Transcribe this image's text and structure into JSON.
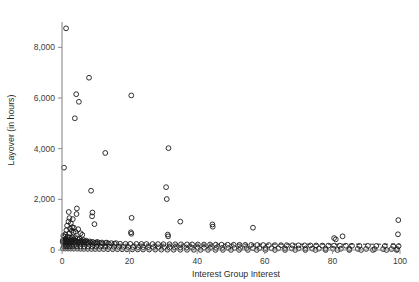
{
  "figure": {
    "background_color": "#ffffff",
    "marker_color": "#1a1a1a",
    "axis_color": "#8a8a8a",
    "text_color": "#2b2b2b"
  },
  "chart_data": {
    "type": "scatter",
    "title": "",
    "xlabel": "Interest Group Interest",
    "ylabel": "Layover (in hours)",
    "xlim": [
      0,
      100
    ],
    "ylim": [
      0,
      9000
    ],
    "xticks": [
      0,
      20,
      40,
      60,
      80,
      100
    ],
    "xtick_labels": [
      "0",
      "20",
      "40",
      "60",
      "80",
      "100"
    ],
    "yticks": [
      0,
      2000,
      4000,
      6000,
      8000
    ],
    "ytick_labels": [
      "0",
      "2,000",
      "4,000",
      "6,000",
      "8,000"
    ],
    "grid": false,
    "legend": null,
    "marker_style": "open-circle",
    "marker_radius": 2.4,
    "reference_line": {
      "style": "dashed",
      "orientation": "horizontal",
      "y": 230,
      "x_start": 0,
      "x_end": 100
    },
    "points": [
      [
        1.2,
        8750
      ],
      [
        8.0,
        6800
      ],
      [
        4.2,
        6150
      ],
      [
        20.5,
        6100
      ],
      [
        5.0,
        5850
      ],
      [
        3.8,
        5200
      ],
      [
        31.5,
        4020
      ],
      [
        12.8,
        3830
      ],
      [
        0.6,
        3250
      ],
      [
        30.8,
        2480
      ],
      [
        8.6,
        2340
      ],
      [
        31.0,
        2010
      ],
      [
        4.4,
        1640
      ],
      [
        2.0,
        1500
      ],
      [
        9.0,
        1480
      ],
      [
        4.3,
        1420
      ],
      [
        8.9,
        1330
      ],
      [
        20.6,
        1270
      ],
      [
        2.2,
        1260
      ],
      [
        3.2,
        1220
      ],
      [
        35.0,
        1120
      ],
      [
        1.9,
        1120
      ],
      [
        2.6,
        1050
      ],
      [
        9.6,
        1020
      ],
      [
        44.5,
        1010
      ],
      [
        44.6,
        920
      ],
      [
        1.5,
        960
      ],
      [
        3.0,
        900
      ],
      [
        3.5,
        880
      ],
      [
        56.5,
        880
      ],
      [
        2.4,
        840
      ],
      [
        4.8,
        820
      ],
      [
        20.4,
        700
      ],
      [
        20.5,
        640
      ],
      [
        1.3,
        780
      ],
      [
        2.9,
        760
      ],
      [
        4.0,
        720
      ],
      [
        3.4,
        690
      ],
      [
        5.5,
        660
      ],
      [
        2.1,
        650
      ],
      [
        1.0,
        620
      ],
      [
        6.0,
        600
      ],
      [
        31.3,
        610
      ],
      [
        31.4,
        540
      ],
      [
        99.5,
        1180
      ],
      [
        99.4,
        620
      ],
      [
        83.0,
        540
      ],
      [
        80.5,
        470
      ],
      [
        81.0,
        420
      ],
      [
        0.4,
        560
      ],
      [
        0.8,
        530
      ],
      [
        1.6,
        520
      ],
      [
        2.3,
        500
      ],
      [
        3.1,
        490
      ],
      [
        3.9,
        470
      ],
      [
        4.6,
        460
      ],
      [
        5.2,
        450
      ],
      [
        1.1,
        440
      ],
      [
        2.7,
        430
      ],
      [
        0.9,
        420
      ],
      [
        1.8,
        410
      ],
      [
        3.3,
        405
      ],
      [
        4.9,
        400
      ],
      [
        6.4,
        395
      ],
      [
        0.3,
        390
      ],
      [
        1.4,
        385
      ],
      [
        2.5,
        380
      ],
      [
        3.7,
        375
      ],
      [
        5.8,
        370
      ],
      [
        7.2,
        365
      ],
      [
        0.6,
        360
      ],
      [
        1.7,
        355
      ],
      [
        2.8,
        350
      ],
      [
        4.1,
        348
      ],
      [
        5.4,
        345
      ],
      [
        6.8,
        342
      ],
      [
        8.2,
        340
      ],
      [
        0.2,
        338
      ],
      [
        1.0,
        335
      ],
      [
        2.0,
        332
      ],
      [
        3.0,
        330
      ],
      [
        4.4,
        328
      ],
      [
        5.9,
        325
      ],
      [
        7.5,
        322
      ],
      [
        9.1,
        320
      ],
      [
        10.5,
        318
      ],
      [
        0.5,
        315
      ],
      [
        1.3,
        312
      ],
      [
        2.2,
        310
      ],
      [
        3.6,
        308
      ],
      [
        5.0,
        305
      ],
      [
        6.6,
        302
      ],
      [
        8.4,
        300
      ],
      [
        10.1,
        298
      ],
      [
        11.8,
        295
      ],
      [
        13.2,
        292
      ],
      [
        0.7,
        290
      ],
      [
        1.9,
        288
      ],
      [
        3.2,
        286
      ],
      [
        4.7,
        284
      ],
      [
        6.2,
        282
      ],
      [
        7.9,
        280
      ],
      [
        9.6,
        278
      ],
      [
        11.2,
        276
      ],
      [
        12.9,
        274
      ],
      [
        14.6,
        272
      ],
      [
        16.0,
        270
      ],
      [
        0.4,
        268
      ],
      [
        1.5,
        266
      ],
      [
        2.6,
        264
      ],
      [
        4.0,
        262
      ],
      [
        5.5,
        260
      ],
      [
        7.1,
        258
      ],
      [
        8.8,
        256
      ],
      [
        10.4,
        254
      ],
      [
        12.1,
        252
      ],
      [
        13.8,
        250
      ],
      [
        15.5,
        248
      ],
      [
        17.2,
        246
      ],
      [
        18.8,
        244
      ],
      [
        20.2,
        242
      ],
      [
        22.0,
        240
      ],
      [
        23.5,
        238
      ],
      [
        25.0,
        236
      ],
      [
        26.8,
        234
      ],
      [
        28.4,
        232
      ],
      [
        30.0,
        230
      ],
      [
        31.8,
        228
      ],
      [
        33.5,
        226
      ],
      [
        35.2,
        224
      ],
      [
        37.0,
        222
      ],
      [
        38.5,
        220
      ],
      [
        40.2,
        218
      ],
      [
        42.0,
        216
      ],
      [
        43.8,
        214
      ],
      [
        45.5,
        212
      ],
      [
        47.2,
        210
      ],
      [
        49.0,
        208
      ],
      [
        50.8,
        206
      ],
      [
        52.5,
        204
      ],
      [
        54.2,
        202
      ],
      [
        56.0,
        200
      ],
      [
        57.8,
        198
      ],
      [
        59.5,
        196
      ],
      [
        61.2,
        194
      ],
      [
        63.0,
        192
      ],
      [
        64.8,
        190
      ],
      [
        66.5,
        188
      ],
      [
        68.2,
        186
      ],
      [
        70.0,
        184
      ],
      [
        71.8,
        182
      ],
      [
        73.5,
        180
      ],
      [
        75.2,
        178
      ],
      [
        77.0,
        176
      ],
      [
        78.8,
        174
      ],
      [
        80.5,
        172
      ],
      [
        82.2,
        170
      ],
      [
        84.0,
        168
      ],
      [
        85.8,
        166
      ],
      [
        88.0,
        164
      ],
      [
        90.5,
        162
      ],
      [
        93.0,
        160
      ],
      [
        95.5,
        158
      ],
      [
        98.0,
        156
      ],
      [
        99.6,
        154
      ],
      [
        0.5,
        150
      ],
      [
        1.2,
        148
      ],
      [
        2.1,
        146
      ],
      [
        3.0,
        144
      ],
      [
        4.2,
        142
      ],
      [
        5.4,
        140
      ],
      [
        6.6,
        138
      ],
      [
        7.8,
        136
      ],
      [
        9.0,
        134
      ],
      [
        10.2,
        132
      ],
      [
        11.5,
        130
      ],
      [
        12.8,
        128
      ],
      [
        14.0,
        126
      ],
      [
        15.4,
        124
      ],
      [
        16.8,
        122
      ],
      [
        18.2,
        120
      ],
      [
        19.6,
        118
      ],
      [
        21.0,
        116
      ],
      [
        22.5,
        114
      ],
      [
        24.0,
        112
      ],
      [
        25.5,
        110
      ],
      [
        27.0,
        108
      ],
      [
        28.5,
        106
      ],
      [
        30.2,
        104
      ],
      [
        31.8,
        102
      ],
      [
        33.4,
        100
      ],
      [
        35.0,
        98
      ],
      [
        36.8,
        96
      ],
      [
        38.5,
        94
      ],
      [
        40.2,
        92
      ],
      [
        42.0,
        90
      ],
      [
        43.8,
        88
      ],
      [
        45.6,
        86
      ],
      [
        47.4,
        84
      ],
      [
        49.2,
        82
      ],
      [
        51.0,
        80
      ],
      [
        52.8,
        78
      ],
      [
        54.6,
        76
      ],
      [
        56.5,
        74
      ],
      [
        58.4,
        72
      ],
      [
        60.2,
        70
      ],
      [
        62.0,
        68
      ],
      [
        64.0,
        66
      ],
      [
        66.0,
        64
      ],
      [
        68.0,
        62
      ],
      [
        70.0,
        60
      ],
      [
        72.0,
        58
      ],
      [
        74.0,
        56
      ],
      [
        76.0,
        54
      ],
      [
        78.0,
        52
      ],
      [
        80.2,
        50
      ],
      [
        82.5,
        48
      ],
      [
        85.0,
        46
      ],
      [
        87.5,
        44
      ],
      [
        90.0,
        42
      ],
      [
        92.5,
        40
      ],
      [
        95.0,
        38
      ],
      [
        97.5,
        36
      ],
      [
        99.2,
        34
      ],
      [
        0.3,
        60
      ],
      [
        1.0,
        58
      ],
      [
        1.8,
        56
      ],
      [
        2.6,
        54
      ],
      [
        3.5,
        52
      ],
      [
        4.5,
        50
      ],
      [
        5.5,
        48
      ],
      [
        6.5,
        46
      ],
      [
        7.6,
        44
      ],
      [
        8.7,
        42
      ],
      [
        9.8,
        40
      ],
      [
        11.0,
        38
      ],
      [
        12.3,
        36
      ],
      [
        13.6,
        34
      ],
      [
        15.0,
        32
      ],
      [
        16.4,
        30
      ],
      [
        17.8,
        28
      ],
      [
        19.2,
        26
      ],
      [
        20.8,
        24
      ],
      [
        22.4,
        22
      ],
      [
        24.0,
        20
      ],
      [
        25.8,
        18
      ],
      [
        27.6,
        16
      ],
      [
        29.4,
        14
      ],
      [
        31.2,
        12
      ],
      [
        33.0,
        10
      ],
      [
        35.0,
        9
      ],
      [
        37.0,
        8
      ],
      [
        39.0,
        7
      ],
      [
        41.0,
        6
      ],
      [
        43.2,
        6
      ],
      [
        45.4,
        5
      ],
      [
        47.6,
        5
      ],
      [
        50.0,
        4
      ],
      [
        52.4,
        4
      ],
      [
        55.0,
        3
      ],
      [
        57.6,
        3
      ],
      [
        60.2,
        3
      ],
      [
        63.0,
        2
      ],
      [
        66.0,
        2
      ],
      [
        69.0,
        2
      ],
      [
        72.0,
        2
      ],
      [
        75.0,
        1
      ],
      [
        78.0,
        1
      ],
      [
        81.5,
        1
      ],
      [
        85.0,
        1
      ],
      [
        88.5,
        1
      ],
      [
        92.0,
        1
      ],
      [
        96.0,
        1
      ],
      [
        99.0,
        1
      ]
    ]
  }
}
